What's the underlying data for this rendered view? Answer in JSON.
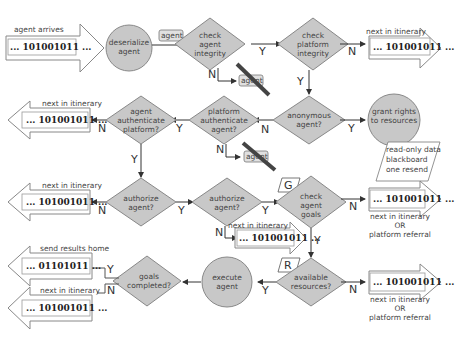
{
  "diagram": {
    "type": "flowchart",
    "colors": {
      "node_fill": "#c8c8c8",
      "node_stroke": "#888888",
      "line": "#333333",
      "strike": "#444444",
      "arrow_fill": "#ffffff"
    },
    "start": {
      "caption": "agent arrives",
      "binary": "... 101001011 ..."
    },
    "nodes": {
      "deserialize": "deserialize agent",
      "check_integrity": "check agent integrity",
      "check_platform": "check platform integrity",
      "anonymous": "anonymous agent?",
      "grant": "grant rights to resources",
      "platform_auth": "platform authenticate agent?",
      "agent_auth": "agent authenticate platform?",
      "authorize_left": "authorize agent?",
      "authorize_mid": "authorize agent?",
      "check_goals": "check agent goals",
      "available": "available resources?",
      "execute": "execute agent",
      "goals_completed": "goals completed?"
    },
    "tags": {
      "agent_packet": "agent",
      "rejected_1": "agent",
      "rejected_2": "agent",
      "goals_tag": "G",
      "resources_tag": "R"
    },
    "grant_note": [
      "read-only data",
      "blackboard",
      "one resend"
    ],
    "edge_labels": {
      "y": "Y",
      "n": "N"
    },
    "exits": {
      "platform_fail": {
        "caption": "next in itinerary",
        "binary": "... 101001011 ..."
      },
      "agent_auth_fail": {
        "caption": "next in itinerary",
        "binary": "... 101001011 ..."
      },
      "authorize_left_fail": {
        "caption": "next in itinerary",
        "binary": "... 101001011 ..."
      },
      "authorize_mid_fail": {
        "caption": "next in itinerary",
        "binary": "... 101001011 ..."
      },
      "goals_fail": {
        "binary": "... 101001011 ...",
        "caption": [
          "next in itinerary",
          "OR",
          "platform referral"
        ]
      },
      "resources_fail": {
        "binary": "... 101001011 ...",
        "caption": [
          "next in itinerary",
          "OR",
          "platform referral"
        ]
      },
      "send_home": {
        "caption": "send results home",
        "binary": "... 01101011 ..."
      },
      "goals_incomplete": {
        "caption": "next in itinerary",
        "binary": "... 101001011 ..."
      }
    }
  }
}
